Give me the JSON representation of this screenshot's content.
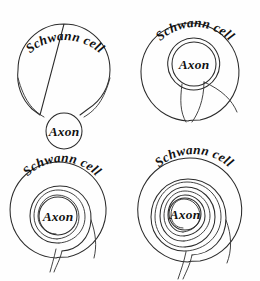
{
  "figure": {
    "background_color": "#fefefe",
    "stroke_color": "#2b2b2b",
    "text_color": "#111111",
    "width": 260,
    "height": 281
  },
  "labels": {
    "schwann_cell": "Schwann cell",
    "axon": "Axon"
  },
  "panels": [
    {
      "id": "panel-1",
      "position": "top-left",
      "stage": 1,
      "schwann_label": "Schwann cell",
      "axon_label": "Axon",
      "wraps": 0,
      "description": "Schwann cell adjacent to axon, axon sits in a shallow groove"
    },
    {
      "id": "panel-2",
      "position": "top-right",
      "stage": 2,
      "schwann_label": "Schwann cell",
      "axon_label": "Axon",
      "wraps": 1,
      "description": "Axon engulfed, single wrap with mesaxon channel"
    },
    {
      "id": "panel-3",
      "position": "bottom-left",
      "stage": 3,
      "schwann_label": "Schwann cell",
      "axon_label": "Axon",
      "wraps": 2,
      "description": "Two spiral wraps of membrane around the axon"
    },
    {
      "id": "panel-4",
      "position": "bottom-right",
      "stage": 4,
      "schwann_label": "Schwann cell",
      "axon_label": "Axon",
      "wraps": 4,
      "description": "Four spiral wraps forming compact myelin sheath"
    }
  ]
}
